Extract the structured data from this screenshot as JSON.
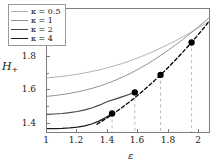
{
  "chart_data": {
    "type": "line",
    "title": "",
    "xlabel": "ε",
    "ylabel": "H₊",
    "xlim": [
      1.0,
      2.07
    ],
    "ylim": [
      1.325,
      2.07
    ],
    "xticks": [
      "1",
      "1.2",
      "1.4",
      "1.6",
      "1.8",
      "2"
    ],
    "xtick_values": [
      1.0,
      1.2,
      1.4,
      1.6,
      1.8,
      2.0
    ],
    "yticks": [
      "1.4",
      "1.6",
      "1.8",
      "2"
    ],
    "ytick_values": [
      1.4,
      1.6,
      1.8,
      2.0
    ],
    "grid": false,
    "legend_position": "upper-left",
    "series": [
      {
        "name": "κ = 0.5",
        "color": "#b0b0b0",
        "linewidth": 1.0,
        "style": "solid",
        "x": [
          1.0,
          1.05,
          1.1,
          1.15,
          1.2,
          1.25,
          1.3,
          1.35,
          1.4,
          1.45,
          1.5,
          1.55,
          1.6,
          1.65,
          1.7,
          1.75,
          1.8,
          1.85,
          1.9,
          1.95,
          2.0,
          2.05,
          2.07
        ],
        "y": [
          1.653,
          1.657,
          1.662,
          1.668,
          1.675,
          1.683,
          1.692,
          1.702,
          1.714,
          1.727,
          1.741,
          1.757,
          1.774,
          1.792,
          1.812,
          1.833,
          1.855,
          1.878,
          1.903,
          1.929,
          1.956,
          1.984,
          1.996
        ]
      },
      {
        "name": "κ = 1",
        "color": "#8f8f8f",
        "linewidth": 1.0,
        "style": "solid",
        "x": [
          1.0,
          1.05,
          1.1,
          1.15,
          1.2,
          1.25,
          1.3,
          1.35,
          1.4,
          1.45,
          1.5,
          1.55,
          1.6,
          1.65,
          1.7,
          1.75,
          1.8,
          1.85,
          1.9,
          1.95,
          2.0,
          2.05,
          2.07
        ],
        "y": [
          1.541,
          1.546,
          1.552,
          1.559,
          1.568,
          1.578,
          1.59,
          1.604,
          1.62,
          1.638,
          1.658,
          1.68,
          1.704,
          1.73,
          1.758,
          1.788,
          1.82,
          1.853,
          1.888,
          1.924,
          1.962,
          2.001,
          2.017
        ]
      },
      {
        "name": "κ = 2",
        "color": "#454545",
        "linewidth": 1.2,
        "style": "solid",
        "x": [
          1.0,
          1.05,
          1.1,
          1.15,
          1.2,
          1.25,
          1.3,
          1.35,
          1.4,
          1.45,
          1.5,
          1.55,
          1.58
        ],
        "y": [
          1.432,
          1.434,
          1.437,
          1.442,
          1.449,
          1.459,
          1.472,
          1.489,
          1.51,
          1.524,
          1.539,
          1.555,
          1.565
        ]
      },
      {
        "name": "κ = 4",
        "color": "#1c1c1c",
        "linewidth": 1.3,
        "style": "solid",
        "x": [
          1.0,
          1.05,
          1.1,
          1.15,
          1.2,
          1.25,
          1.3,
          1.35,
          1.4,
          1.43
        ],
        "y": [
          1.345,
          1.3455,
          1.347,
          1.3495,
          1.354,
          1.362,
          1.375,
          1.394,
          1.419,
          1.437
        ]
      },
      {
        "name": "limit-curve",
        "color": "#000000",
        "linewidth": 1.3,
        "style": "dashed",
        "x": [
          1.33,
          1.4,
          1.45,
          1.5,
          1.55,
          1.6,
          1.65,
          1.7,
          1.75,
          1.8,
          1.85,
          1.9,
          1.95,
          2.0,
          2.05,
          2.07
        ],
        "y": [
          1.372,
          1.412,
          1.443,
          1.476,
          1.511,
          1.548,
          1.587,
          1.628,
          1.671,
          1.716,
          1.763,
          1.812,
          1.863,
          1.916,
          1.971,
          1.994
        ]
      }
    ],
    "markers": [
      {
        "label": "κ = 4 critical point",
        "x": 1.43,
        "y": 1.437,
        "color": "#000000",
        "size": 3.2
      },
      {
        "label": "κ = 2 critical point",
        "x": 1.58,
        "y": 1.565,
        "color": "#000000",
        "size": 3.2
      },
      {
        "label": "κ = 1 critical point",
        "x": 1.75,
        "y": 1.671,
        "color": "#000000",
        "size": 3.2
      },
      {
        "label": "κ = 0.5 critical point",
        "x": 1.955,
        "y": 1.867,
        "color": "#000000",
        "size": 3.2
      }
    ],
    "droplines": [
      {
        "x": 1.43,
        "y_top": 1.437,
        "style": "dashed",
        "color": "#a8a8a8"
      },
      {
        "x": 1.58,
        "y_top": 1.565,
        "style": "dashed",
        "color": "#a8a8a8"
      },
      {
        "x": 1.75,
        "y_top": 1.671,
        "style": "dashed",
        "color": "#a8a8a8"
      },
      {
        "x": 1.955,
        "y_top": 1.867,
        "style": "dashed",
        "color": "#a8a8a8"
      }
    ]
  },
  "axes": {
    "ylabel_main": "H",
    "ylabel_sub": "+",
    "xlabel": "ε"
  },
  "legend": {
    "items": [
      {
        "label": "κ = 0.5",
        "symbol": "κ",
        "value": "0.5",
        "color": "#b0b0b0"
      },
      {
        "label": "κ = 1",
        "symbol": "κ",
        "value": "1",
        "color": "#8f8f8f"
      },
      {
        "label": "κ = 2",
        "symbol": "κ",
        "value": "2",
        "color": "#454545"
      },
      {
        "label": "κ = 4",
        "symbol": "κ",
        "value": "4",
        "color": "#1c1c1c"
      }
    ]
  },
  "ticks": {
    "x": [
      "1",
      "1.2",
      "1.4",
      "1.6",
      "1.8",
      "2"
    ],
    "y": [
      "1.4",
      "1.6",
      "1.8",
      "2"
    ]
  }
}
